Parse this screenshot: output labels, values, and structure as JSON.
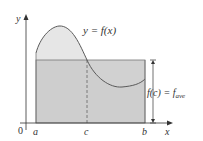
{
  "figure": {
    "curve_label": "y = f(x)",
    "height_label_main": "f(c) = f",
    "height_label_sub": "ave",
    "axis_y_label": "y",
    "axis_x_label": "x",
    "origin_label": "0",
    "tick_a": "a",
    "tick_c": "c",
    "tick_b": "b",
    "colors": {
      "rectangle_fill": "#c9c9c9",
      "curve_region_fill": "#e6e6e6",
      "curve_stroke": "#5a5a5a",
      "axis": "#333333"
    }
  }
}
